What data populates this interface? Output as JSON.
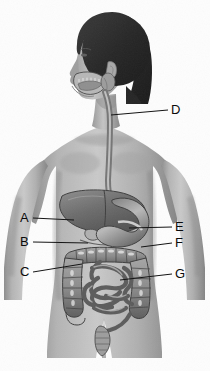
{
  "figure": {
    "view": "anterior body with left-facing head profile",
    "style": "grayscale halftone medical illustration",
    "background_color": "#fdfdfd",
    "line_color": "#111111",
    "label_color": "#0b0b0b"
  },
  "labels": [
    {
      "key": "A",
      "text": "A",
      "side": "left",
      "x": 22,
      "y": 212,
      "leader_to_x": 74,
      "leader_to_y": 220,
      "organ": "liver"
    },
    {
      "key": "B",
      "text": "B",
      "side": "left",
      "x": 22,
      "y": 236,
      "leader_to_x": 88,
      "leader_to_y": 243,
      "organ": "gallbladder"
    },
    {
      "key": "C",
      "text": "C",
      "side": "left",
      "x": 22,
      "y": 266,
      "leader_to_x": 82,
      "leader_to_y": 264,
      "organ": "ascending colon"
    },
    {
      "key": "D",
      "text": "D",
      "side": "right",
      "x": 172,
      "y": 104,
      "leader_to_x": 111,
      "leader_to_y": 115,
      "organ": "esophagus"
    },
    {
      "key": "E",
      "text": "E",
      "side": "right",
      "x": 176,
      "y": 221,
      "leader_to_x": 129,
      "leader_to_y": 228,
      "organ": "stomach"
    },
    {
      "key": "F",
      "text": "F",
      "side": "right",
      "x": 176,
      "y": 237,
      "leader_to_x": 141,
      "leader_to_y": 247,
      "organ": "transverse colon"
    },
    {
      "key": "G",
      "text": "G",
      "side": "right",
      "x": 176,
      "y": 268,
      "leader_to_x": 120,
      "leader_to_y": 280,
      "organ": "small intestine"
    }
  ],
  "organs": [
    {
      "name": "oral-cavity",
      "label_key": null
    },
    {
      "name": "salivary-gland",
      "label_key": null
    },
    {
      "name": "esophagus",
      "label_key": "D"
    },
    {
      "name": "liver",
      "label_key": "A"
    },
    {
      "name": "gallbladder",
      "label_key": "B"
    },
    {
      "name": "stomach",
      "label_key": "E"
    },
    {
      "name": "transverse-colon",
      "label_key": "F"
    },
    {
      "name": "ascending-colon",
      "label_key": "C"
    },
    {
      "name": "small-intestine",
      "label_key": "G"
    },
    {
      "name": "descending-colon",
      "label_key": null
    },
    {
      "name": "rectum",
      "label_key": null
    }
  ]
}
